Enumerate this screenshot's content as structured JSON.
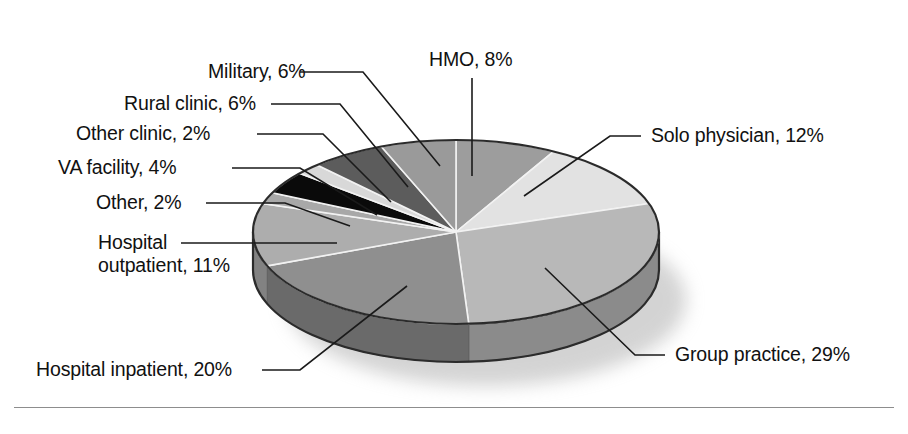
{
  "figure": {
    "background_color": "#ffffff",
    "rule_color": "#8d8d8d",
    "text_color": "#111111"
  },
  "chart_data": {
    "type": "pie",
    "title": "",
    "subtitle": "",
    "xlabel": "",
    "ylabel": "",
    "legend_position": "none",
    "grid": false,
    "style": "3d-exploded-grayscale",
    "units": "percent",
    "total": 100,
    "start_angle_deg": 0,
    "direction": "clockwise",
    "labels": [
      "HMO",
      "Solo physician",
      "Group practice",
      "Hospital inpatient",
      "Hospital outpatient",
      "Other",
      "VA facility",
      "Other clinic",
      "Rural clinic",
      "Military"
    ],
    "values": [
      8,
      12,
      29,
      20,
      11,
      2,
      4,
      2,
      6,
      6
    ],
    "slices": [
      {
        "label": "HMO",
        "value": 8,
        "text": "HMO, 8%",
        "color": "#9d9d9d",
        "side_color": "#6f6f6f"
      },
      {
        "label": "Solo physician",
        "value": 12,
        "text": "Solo physician, 12%",
        "color": "#e2e2e2",
        "side_color": "#b2b2b2"
      },
      {
        "label": "Group practice",
        "value": 29,
        "text": "Group practice, 29%",
        "color": "#b8b8b8",
        "side_color": "#8b8b8b"
      },
      {
        "label": "Hospital inpatient",
        "value": 20,
        "text": "Hospital inpatient, 20%",
        "color": "#8f8f8f",
        "side_color": "#6a6a6a"
      },
      {
        "label": "Hospital outpatient",
        "value": 11,
        "text": "Hospital outpatient, 11%",
        "color": "#adadad",
        "side_color": "#828282"
      },
      {
        "label": "Other",
        "value": 2,
        "text": "Other, 2%",
        "color": "#a8a8a8",
        "side_color": "#7c7c7c"
      },
      {
        "label": "VA facility",
        "value": 4,
        "text": "VA facility, 4%",
        "color": "#0a0a0a",
        "side_color": "#000000"
      },
      {
        "label": "Other clinic",
        "value": 2,
        "text": "Other clinic, 2%",
        "color": "#d8d8d8",
        "side_color": "#a6a6a6"
      },
      {
        "label": "Rural clinic",
        "value": 6,
        "text": "Rural clinic, 6%",
        "color": "#5c5c5c",
        "side_color": "#454545"
      },
      {
        "label": "Military",
        "value": 6,
        "text": "Military, 6%",
        "color": "#9a9a9a",
        "side_color": "#737373"
      }
    ]
  },
  "labels": {
    "military": "Military, 6%",
    "rural_clinic": "Rural clinic, 6%",
    "other_clinic": "Other clinic, 2%",
    "va_facility": "VA facility, 4%",
    "other": "Other, 2%",
    "hospital_outpatient_line1": "Hospital",
    "hospital_outpatient_line2": "outpatient, 11%",
    "hospital_inpatient": "Hospital inpatient, 20%",
    "hmo": "HMO, 8%",
    "solo_physician": "Solo physician, 12%",
    "group_practice": "Group practice, 29%"
  }
}
